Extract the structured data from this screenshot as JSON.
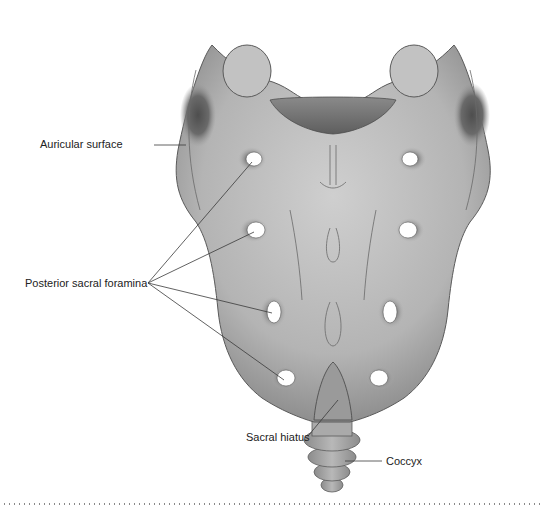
{
  "figure": {
    "colors": {
      "bone_light": "#c9c9c9",
      "bone_mid": "#aaaaaa",
      "bone_dark": "#6e6e6e",
      "outline": "#5a5a5a",
      "leader": "#3a3a3a",
      "text": "#222222"
    }
  },
  "labels": {
    "auricular_surface": "Auricular surface",
    "posterior_sacral_foramina": "Posterior sacral foramina",
    "sacral_hiatus": "Sacral hiatus",
    "coccyx": "Coccyx"
  }
}
